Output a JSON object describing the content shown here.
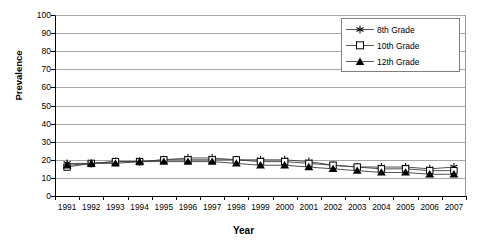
{
  "chart_data": {
    "type": "line",
    "title": "",
    "xlabel": "Year",
    "ylabel": "Prevalence",
    "grid": true,
    "legend_position": "top-right-inside",
    "ylim": [
      0,
      100
    ],
    "yticks": [
      0,
      10,
      20,
      30,
      40,
      50,
      60,
      70,
      80,
      90,
      100
    ],
    "categories": [
      "1991",
      "1992",
      "1993",
      "1994",
      "1995",
      "1996",
      "1997",
      "1998",
      "1999",
      "2000",
      "2001",
      "2002",
      "2003",
      "2004",
      "2005",
      "2006",
      "2007"
    ],
    "x": [
      1991,
      1992,
      1993,
      1994,
      1995,
      1996,
      1997,
      1998,
      1999,
      2000,
      2001,
      2002,
      2003,
      2004,
      2005,
      2006,
      2007
    ],
    "series": [
      {
        "name": "8th Grade",
        "marker": "asterisk",
        "values": [
          18,
          18,
          19,
          19,
          20,
          21,
          21,
          20,
          20,
          20,
          19,
          17,
          16,
          16,
          16,
          15,
          16
        ]
      },
      {
        "name": "10th Grade",
        "marker": "open-square",
        "values": [
          16,
          18,
          19,
          19,
          20,
          20,
          20,
          20,
          19,
          19,
          18,
          17,
          16,
          15,
          15,
          14,
          14
        ]
      },
      {
        "name": "12th Grade",
        "marker": "filled-triangle",
        "values": [
          17,
          18,
          18,
          19,
          19,
          19,
          19,
          18,
          17,
          17,
          16,
          15,
          14,
          13,
          13,
          12,
          12
        ]
      }
    ]
  },
  "legend": {
    "items": [
      {
        "label": "8th Grade"
      },
      {
        "label": "10th Grade"
      },
      {
        "label": "12th Grade"
      }
    ]
  },
  "axes": {
    "y_title": "Prevalence",
    "x_title": "Year",
    "y_tick_labels": [
      "100",
      "90",
      "80",
      "70",
      "60",
      "50",
      "40",
      "30",
      "20",
      "10",
      "0"
    ],
    "x_tick_labels": [
      "1991",
      "1992",
      "1993",
      "1994",
      "1995",
      "1996",
      "1997",
      "1998",
      "1999",
      "2000",
      "2001",
      "2002",
      "2003",
      "2004",
      "2005",
      "2006",
      "2007"
    ]
  }
}
